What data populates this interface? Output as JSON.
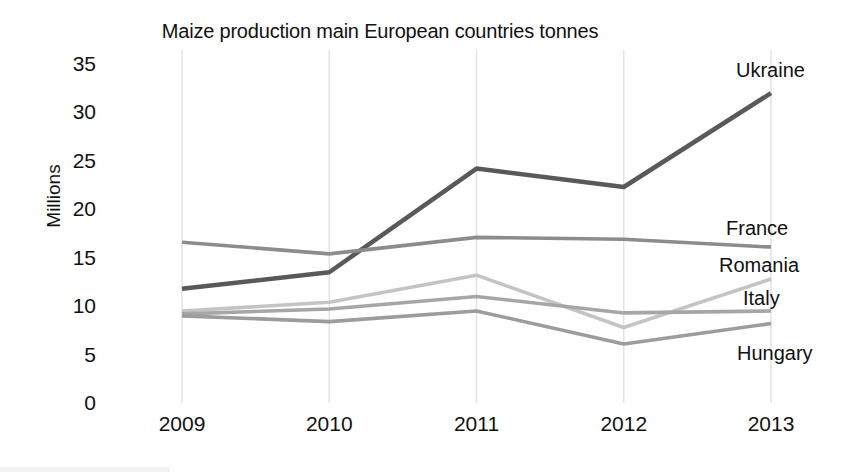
{
  "chart_data": {
    "type": "line",
    "title": "Maize production main European countries tonnes",
    "xlabel": "",
    "ylabel": "Millions",
    "categories": [
      "2009",
      "2010",
      "2011",
      "2012",
      "2013"
    ],
    "ylim": [
      0,
      35
    ],
    "yticks": [
      "0",
      "5",
      "10",
      "15",
      "20",
      "25",
      "30",
      "35"
    ],
    "ytick_values": [
      0,
      5,
      10,
      15,
      20,
      25,
      30,
      35
    ],
    "grid": "vertical-only",
    "legend_position": "right-inline-labels",
    "series": [
      {
        "name": "Ukraine",
        "values": [
          11.8,
          13.5,
          24.2,
          22.3,
          32.0
        ],
        "color": "#595959"
      },
      {
        "name": "France",
        "values": [
          16.6,
          15.4,
          17.1,
          16.9,
          16.1
        ],
        "color": "#8c8c8c"
      },
      {
        "name": "Romania",
        "values": [
          9.5,
          10.4,
          13.2,
          7.8,
          12.8
        ],
        "color": "#c4c4c4"
      },
      {
        "name": "Italy",
        "values": [
          9.2,
          9.7,
          11.0,
          9.3,
          9.5
        ],
        "color": "#a6a6a6"
      },
      {
        "name": "Hungary",
        "values": [
          9.0,
          8.4,
          9.5,
          6.1,
          8.2
        ],
        "color": "#9c9c9c"
      }
    ]
  },
  "labels": {
    "ukraine": "Ukraine",
    "france": "France",
    "romania": "Romania",
    "italy": "Italy",
    "hungary": "Hungary"
  },
  "colors": {
    "background": "#ffffff",
    "text": "#111111",
    "gridline": "#e3e3e3"
  }
}
